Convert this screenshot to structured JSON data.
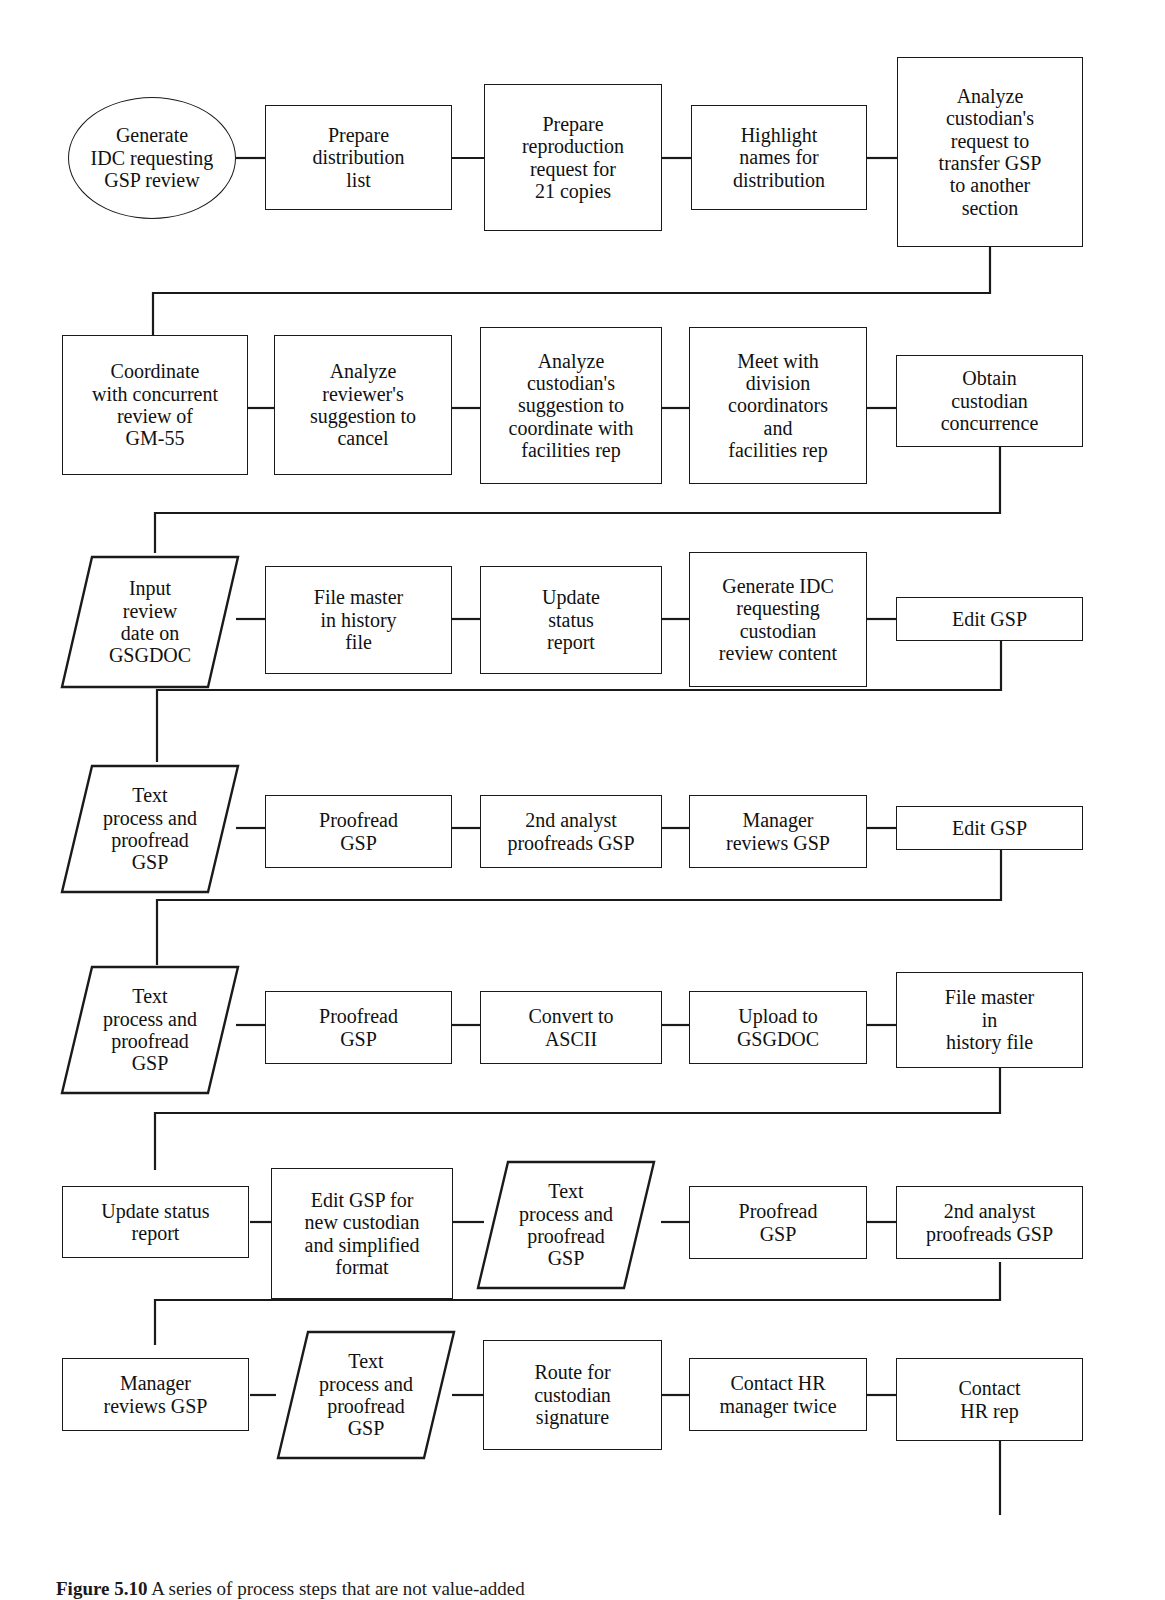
{
  "figure": {
    "caption_label": "Figure 5.10",
    "caption_text": "A series of process steps that are not value-added"
  },
  "diagram": {
    "type": "flowchart",
    "orientation": "serpentine-left-to-right",
    "shapes_legend": {
      "ellipse": "terminator / start",
      "rectangle": "process step",
      "parallelogram": "input-output step"
    },
    "rows": [
      {
        "row": 1,
        "nodes": [
          {
            "id": "n1",
            "shape": "ellipse",
            "label": "Generate\nIDC requesting\nGSP review"
          },
          {
            "id": "n2",
            "shape": "rectangle",
            "label": "Prepare\ndistribution\nlist"
          },
          {
            "id": "n3",
            "shape": "rectangle",
            "label": "Prepare\nreproduction\nrequest for\n21 copies"
          },
          {
            "id": "n4",
            "shape": "rectangle",
            "label": "Highlight\nnames for\ndistribution"
          },
          {
            "id": "n5",
            "shape": "rectangle",
            "label": "Analyze\ncustodian's\nrequest to\ntransfer GSP\nto another\nsection"
          }
        ]
      },
      {
        "row": 2,
        "nodes": [
          {
            "id": "n6",
            "shape": "rectangle",
            "label": "Coordinate\nwith concurrent\nreview of\nGM-55"
          },
          {
            "id": "n7",
            "shape": "rectangle",
            "label": "Analyze\nreviewer's\nsuggestion to\ncancel"
          },
          {
            "id": "n8",
            "shape": "rectangle",
            "label": "Analyze\ncustodian's\nsuggestion to\ncoordinate with\nfacilities rep"
          },
          {
            "id": "n9",
            "shape": "rectangle",
            "label": "Meet with\ndivision\ncoordinators\nand\nfacilities rep"
          },
          {
            "id": "n10",
            "shape": "rectangle",
            "label": "Obtain\ncustodian\nconcurrence"
          }
        ]
      },
      {
        "row": 3,
        "nodes": [
          {
            "id": "n11",
            "shape": "parallelogram",
            "label": "Input\nreview\ndate on\nGSGDOC"
          },
          {
            "id": "n12",
            "shape": "rectangle",
            "label": "File master\nin history\nfile"
          },
          {
            "id": "n13",
            "shape": "rectangle",
            "label": "Update\nstatus\nreport"
          },
          {
            "id": "n14",
            "shape": "rectangle",
            "label": "Generate IDC\nrequesting\ncustodian\nreview content"
          },
          {
            "id": "n15",
            "shape": "rectangle",
            "label": "Edit GSP"
          }
        ]
      },
      {
        "row": 4,
        "nodes": [
          {
            "id": "n16",
            "shape": "parallelogram",
            "label": "Text\nprocess and\nproofread\nGSP"
          },
          {
            "id": "n17",
            "shape": "rectangle",
            "label": "Proofread\nGSP"
          },
          {
            "id": "n18",
            "shape": "rectangle",
            "label": "2nd analyst\nproofreads GSP"
          },
          {
            "id": "n19",
            "shape": "rectangle",
            "label": "Manager\nreviews GSP"
          },
          {
            "id": "n20",
            "shape": "rectangle",
            "label": "Edit GSP"
          }
        ]
      },
      {
        "row": 5,
        "nodes": [
          {
            "id": "n21",
            "shape": "parallelogram",
            "label": "Text\nprocess and\nproofread\nGSP"
          },
          {
            "id": "n22",
            "shape": "rectangle",
            "label": "Proofread\nGSP"
          },
          {
            "id": "n23",
            "shape": "rectangle",
            "label": "Convert to\nASCII"
          },
          {
            "id": "n24",
            "shape": "rectangle",
            "label": "Upload to\nGSGDOC"
          },
          {
            "id": "n25",
            "shape": "rectangle",
            "label": "File master\nin\nhistory file"
          }
        ]
      },
      {
        "row": 6,
        "nodes": [
          {
            "id": "n26",
            "shape": "rectangle",
            "label": "Update status\nreport"
          },
          {
            "id": "n27",
            "shape": "rectangle",
            "label": "Edit GSP for\nnew custodian\nand simplified\nformat"
          },
          {
            "id": "n28",
            "shape": "parallelogram",
            "label": "Text\nprocess and\nproofread\nGSP"
          },
          {
            "id": "n29",
            "shape": "rectangle",
            "label": "Proofread\nGSP"
          },
          {
            "id": "n30",
            "shape": "rectangle",
            "label": "2nd analyst\nproofreads GSP"
          }
        ]
      },
      {
        "row": 7,
        "nodes": [
          {
            "id": "n31",
            "shape": "rectangle",
            "label": "Manager\nreviews GSP"
          },
          {
            "id": "n32",
            "shape": "parallelogram",
            "label": "Text\nprocess and\nproofread\nGSP"
          },
          {
            "id": "n33",
            "shape": "rectangle",
            "label": "Route for\ncustodian\nsignature"
          },
          {
            "id": "n34",
            "shape": "rectangle",
            "label": "Contact HR\nmanager twice"
          },
          {
            "id": "n35",
            "shape": "rectangle",
            "label": "Contact\nHR rep"
          }
        ]
      }
    ],
    "colors": {
      "stroke": "#1a1a1a",
      "fill": "#ffffff",
      "text": "#111111"
    }
  }
}
